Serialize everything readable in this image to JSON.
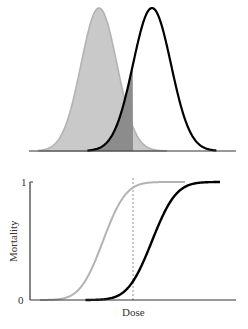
{
  "chart_data": [
    {
      "type": "area",
      "title": "",
      "description": "Two normal tolerance distributions (gray = susceptible, black outline = resistant); overlap region up to dose threshold shaded dark gray",
      "xlabel": "",
      "ylabel": "",
      "series": [
        {
          "name": "gray-distribution",
          "mean_px": 99,
          "sigma_px": 18,
          "style": "filled",
          "fill": "#c9c9c9",
          "stroke": "#b3b3b3"
        },
        {
          "name": "black-distribution",
          "mean_px": 152,
          "sigma_px": 19,
          "style": "outline",
          "fill": "none",
          "stroke": "#000000"
        }
      ],
      "shaded_overlap": {
        "to_x_px": 133,
        "fill": "#8c8c8c"
      },
      "axes": {
        "baseline_y_px": 151,
        "x_start_px": 29,
        "x_end_px": 236,
        "peak_y_px": 8
      }
    },
    {
      "type": "line",
      "title": "",
      "xlabel": "Dose",
      "ylabel": "Mortality",
      "yticks": [
        "0",
        "1"
      ],
      "ylim": [
        0,
        1
      ],
      "series": [
        {
          "name": "gray-mortality",
          "mean_px": 103,
          "sigma_px": 18,
          "stroke": "#b3b3b3"
        },
        {
          "name": "black-mortality",
          "mean_px": 152,
          "sigma_px": 19,
          "stroke": "#000000"
        }
      ],
      "threshold_dose_px": 133,
      "axes": {
        "y0_px": 300,
        "y1_px": 182,
        "x_start_px": 30,
        "x_end_px": 236,
        "curve_end_px": 220
      }
    }
  ],
  "labels": {
    "y_tick_1": "1",
    "y_tick_0": "0",
    "y_axis": "Mortality",
    "x_axis": "Dose"
  }
}
